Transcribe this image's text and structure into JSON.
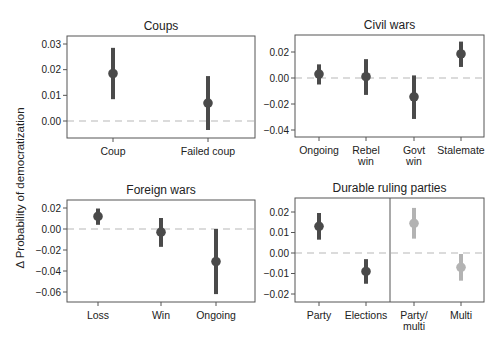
{
  "figure": {
    "ylabel": "Δ Probability of democratization",
    "colors": {
      "point_dark": "#4a4a4a",
      "point_light": "#b3b3b3",
      "frame": "#555555",
      "zero_line": "#b8b8b8"
    }
  },
  "chart_data": [
    {
      "type": "scatter",
      "title": "Coups",
      "categories": [
        "Coup",
        "Failed coup"
      ],
      "values": [
        0.0185,
        0.007
      ],
      "ci_low": [
        0.0085,
        -0.0035
      ],
      "ci_high": [
        0.0285,
        0.0175
      ],
      "yticks": [
        0.0,
        0.01,
        0.02,
        0.03
      ],
      "ytick_labels": [
        "0.00",
        "0.01",
        "0.02",
        "0.03"
      ],
      "ylim": [
        -0.007,
        0.034
      ],
      "reference_line": 0,
      "box": {
        "x0": 67,
        "x1": 255,
        "y0": 36,
        "y1": 138
      },
      "tick_px": {
        "0.03": 44,
        "0.00": 121
      },
      "cat_x": [
        113,
        208
      ],
      "colors": [
        "dark",
        "dark"
      ]
    },
    {
      "type": "scatter",
      "title": "Civil wars",
      "categories": [
        "Ongoing",
        "Rebel\nwin",
        "Govt\nwin",
        "Stalemate"
      ],
      "values": [
        0.003,
        0.001,
        -0.0145,
        0.0185
      ],
      "ci_low": [
        -0.005,
        -0.013,
        -0.0315,
        0.0085
      ],
      "ci_high": [
        0.0105,
        0.0145,
        0.002,
        0.028
      ],
      "yticks": [
        -0.04,
        -0.02,
        0.0,
        0.02
      ],
      "ytick_labels": [
        "−0.04",
        "−0.02",
        "0.00",
        "0.02"
      ],
      "ylim": [
        -0.045,
        0.034
      ],
      "reference_line": 0,
      "box": {
        "x0": 295,
        "x1": 484,
        "y0": 35,
        "y1": 137
      },
      "tick_px": {
        "0.02": 52,
        "-0.04": 130
      },
      "cat_x": [
        319,
        366,
        414,
        461
      ],
      "colors": [
        "dark",
        "dark",
        "dark",
        "dark"
      ]
    },
    {
      "type": "scatter",
      "title": "Foreign wars",
      "categories": [
        "Loss",
        "Win",
        "Ongoing"
      ],
      "values": [
        0.012,
        -0.003,
        -0.031
      ],
      "ci_low": [
        0.004,
        -0.017,
        -0.062
      ],
      "ci_high": [
        0.0195,
        0.0105,
        0.0
      ],
      "yticks": [
        -0.06,
        -0.04,
        -0.02,
        0.0,
        0.02
      ],
      "ytick_labels": [
        "−0.06",
        "−0.04",
        "−0.02",
        "0.00",
        "0.02"
      ],
      "ylim": [
        -0.069,
        0.026
      ],
      "reference_line": 0,
      "box": {
        "x0": 67,
        "x1": 255,
        "y0": 200,
        "y1": 302
      },
      "tick_px": {
        "0.02": 208,
        "-0.06": 292
      },
      "cat_x": [
        98,
        161,
        216
      ],
      "colors": [
        "dark",
        "dark",
        "dark"
      ]
    },
    {
      "type": "scatter",
      "title": "Durable ruling parties",
      "categories": [
        "Party",
        "Elections",
        "Party/\nmulti",
        "Multi"
      ],
      "values": [
        0.013,
        -0.009,
        0.0145,
        -0.007
      ],
      "ci_low": [
        0.0065,
        -0.015,
        0.007,
        -0.0135
      ],
      "ci_high": [
        0.0195,
        -0.003,
        0.022,
        -0.0005
      ],
      "yticks": [
        -0.02,
        -0.01,
        0.0,
        0.01,
        0.02
      ],
      "ytick_labels": [
        "−0.02",
        "−0.01",
        "0.00",
        "0.01",
        "0.02"
      ],
      "ylim": [
        -0.024,
        0.026
      ],
      "reference_line": 0,
      "divider_between": [
        1,
        2
      ],
      "box": {
        "x0": 295,
        "x1": 484,
        "y0": 198,
        "y1": 302
      },
      "tick_px": {
        "0.02": 212,
        "-0.02": 294
      },
      "divider_x": 390,
      "cat_x": [
        319,
        366,
        414,
        461
      ],
      "colors": [
        "dark",
        "dark",
        "light",
        "light"
      ]
    }
  ]
}
